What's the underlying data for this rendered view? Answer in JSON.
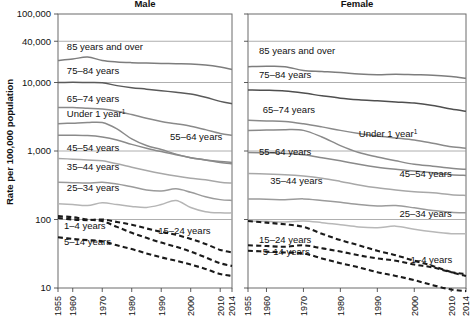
{
  "figure": {
    "y_axis_title": "Rate per 100,000 population",
    "panels": [
      {
        "id": "male",
        "title": "Male"
      },
      {
        "id": "female",
        "title": "Female"
      }
    ],
    "y_ticks": [
      {
        "value": 10,
        "label": "10"
      },
      {
        "value": 100,
        "label": "100"
      },
      {
        "value": 1000,
        "label": "1,000"
      },
      {
        "value": 10000,
        "label": "10,000"
      },
      {
        "value": 40000,
        "label": "40,000"
      },
      {
        "value": 100000,
        "label": "100,000"
      }
    ],
    "x_ticks": [
      {
        "value": 1955,
        "label": "1955"
      },
      {
        "value": 1960,
        "label": "1960"
      },
      {
        "value": 1970,
        "label": "1970"
      },
      {
        "value": 1980,
        "label": "1980"
      },
      {
        "value": 1990,
        "label": "1990"
      },
      {
        "value": 2000,
        "label": "2000"
      },
      {
        "value": 2010,
        "label": "2010"
      },
      {
        "value": 2014,
        "label": "2014"
      }
    ],
    "footnote_marker": "1"
  },
  "chart_data": {
    "type": "line",
    "xlabel": "",
    "ylabel": "Rate per 100,000 population",
    "yscale": "log",
    "ylim": [
      10,
      100000
    ],
    "xlim": [
      1955,
      2014
    ],
    "grid": true,
    "legend": "inline-labels",
    "x": [
      1955,
      1960,
      1965,
      1970,
      1975,
      1980,
      1985,
      1990,
      1995,
      2000,
      2005,
      2010,
      2014
    ],
    "panels": [
      {
        "panel": "Male",
        "series": [
          {
            "name": "85 years and over",
            "label": "85 years and over",
            "style": "solid",
            "color": "#7d7d7d",
            "label_x": 1958,
            "label_y": 30000,
            "values": [
              21000,
              22000,
              23500,
              21000,
              20000,
              19500,
              19200,
              19000,
              18800,
              18600,
              18000,
              16800,
              15500
            ]
          },
          {
            "name": "75-84 years",
            "label": "75–84 years",
            "style": "solid",
            "color": "#5a5a5a",
            "label_x": 1958,
            "label_y": 13500,
            "values": [
              10000,
              10100,
              10000,
              9900,
              9000,
              8400,
              8000,
              7600,
              7200,
              6800,
              6100,
              5300,
              4900
            ]
          },
          {
            "name": "65-74 years",
            "label": "65–74 years",
            "style": "solid",
            "color": "#8a8a8a",
            "label_x": 1958,
            "label_y": 5200,
            "values": [
              4300,
              4300,
              4200,
              4100,
              3800,
              3400,
              3000,
              2700,
              2500,
              2300,
              2050,
              1800,
              1700
            ]
          },
          {
            "name": "Under 1 year",
            "label": "Under 1 year",
            "style": "solid",
            "color": "#8a8a8a",
            "label_x": 1958,
            "label_y": 3100,
            "values": [
              2500,
              2550,
              2600,
              2600,
              2100,
              1500,
              1200,
              1050,
              900,
              800,
              740,
              680,
              650
            ]
          },
          {
            "name": "55-64 years",
            "label": "55–64 years",
            "style": "solid",
            "color": "#8a8a8a",
            "label_x": 1993,
            "label_y": 1450,
            "values": [
              1700,
              1700,
              1680,
              1600,
              1450,
              1250,
              1100,
              980,
              880,
              800,
              740,
              700,
              680
            ]
          },
          {
            "name": "45-54 years",
            "label": "45–54 years",
            "style": "solid",
            "color": "#a8a8a8",
            "label_x": 1958,
            "label_y": 1000,
            "values": [
              780,
              760,
              740,
              720,
              650,
              580,
              520,
              470,
              430,
              400,
              380,
              350,
              340
            ]
          },
          {
            "name": "35-44 years",
            "label": "35–44 years",
            "style": "solid",
            "color": "#9b9b9b",
            "label_x": 1958,
            "label_y": 520,
            "values": [
              350,
              345,
              340,
              350,
              330,
              300,
              270,
              260,
              280,
              250,
              215,
              195,
              190
            ]
          },
          {
            "name": "25-34 years",
            "label": "25–34 years",
            "style": "solid",
            "color": "#b5b5b5",
            "label_x": 1958,
            "label_y": 260,
            "values": [
              170,
              165,
              160,
              175,
              165,
              155,
              150,
              165,
              190,
              150,
              130,
              125,
              125
            ]
          },
          {
            "name": "15-24 years",
            "label": "15–24 years",
            "style": "dashed",
            "color": "#1a1a1a",
            "label_x": 1989,
            "label_y": 62,
            "values": [
              105,
              100,
              98,
              100,
              92,
              84,
              74,
              66,
              60,
              52,
              44,
              36,
              33
            ]
          },
          {
            "name": "1-4 years",
            "label": "1–4 years",
            "style": "dashed",
            "color": "#1a1a1a",
            "label_x": 1957,
            "label_y": 72,
            "values": [
              112,
              108,
              100,
              95,
              78,
              64,
              54,
              46,
              40,
              34,
              28,
              23,
              21
            ]
          },
          {
            "name": "5-14 years",
            "label": "5–14 years",
            "style": "dashed",
            "color": "#1a1a1a",
            "label_x": 1957,
            "label_y": 43,
            "values": [
              55,
              52,
              50,
              48,
              42,
              37,
              32,
              28,
              25,
              22,
              19,
              16,
              15
            ]
          }
        ]
      },
      {
        "panel": "Female",
        "series": [
          {
            "name": "85 years and over",
            "label": "85 years and over",
            "style": "solid",
            "color": "#7d7d7d",
            "label_x": 1958,
            "label_y": 26000,
            "values": [
              17000,
              17200,
              17000,
              15000,
              14500,
              14000,
              13300,
              13000,
              13200,
              13000,
              12800,
              12200,
              11500
            ]
          },
          {
            "name": "75-84 years",
            "label": "75–84 years",
            "style": "solid",
            "color": "#4f4f4f",
            "label_x": 1958,
            "label_y": 11500,
            "values": [
              7800,
              7700,
              7500,
              7000,
              6400,
              5900,
              5600,
              5400,
              5200,
              5000,
              4600,
              4100,
              3800
            ]
          },
          {
            "name": "65-74 years",
            "label": "65–74 years",
            "style": "solid",
            "color": "#8a8a8a",
            "label_x": 1959,
            "label_y": 3600,
            "values": [
              2800,
              2750,
              2700,
              2500,
              2250,
              2000,
              1800,
              1650,
              1550,
              1450,
              1300,
              1150,
              1100
            ]
          },
          {
            "name": "Under 1 year",
            "label": "Under 1 year",
            "style": "solid",
            "color": "#8a8a8a",
            "label_x": 1985,
            "label_y": 1600,
            "values": [
              2000,
              2020,
              2050,
              2000,
              1600,
              1200,
              950,
              820,
              720,
              640,
              600,
              560,
              540
            ]
          },
          {
            "name": "55-64 years",
            "label": "55–64 years",
            "style": "solid",
            "color": "#8a8a8a",
            "label_x": 1958,
            "label_y": 880,
            "values": [
              950,
              940,
              920,
              880,
              800,
              720,
              640,
              580,
              540,
              510,
              480,
              450,
              440
            ]
          },
          {
            "name": "45-54 years",
            "label": "45–54 years",
            "style": "solid",
            "color": "#a8a8a8",
            "label_x": 1996,
            "label_y": 420,
            "values": [
              470,
              460,
              450,
              430,
              400,
              360,
              320,
              290,
              270,
              255,
              245,
              230,
              225
            ]
          },
          {
            "name": "35-44 years",
            "label": "35–44 years",
            "style": "solid",
            "color": "#9b9b9b",
            "label_x": 1961,
            "label_y": 330,
            "values": [
              200,
              198,
              195,
              200,
              190,
              178,
              165,
              158,
              160,
              148,
              135,
              128,
              125
            ]
          },
          {
            "name": "25-34 years",
            "label": "25–34 years",
            "style": "solid",
            "color": "#b8b8b8",
            "label_x": 1996,
            "label_y": 110,
            "values": [
              95,
              94,
              92,
              95,
              90,
              84,
              78,
              76,
              80,
              72,
              66,
              62,
              62
            ]
          },
          {
            "name": "15-24 years",
            "label": "15–24 years",
            "style": "dashed",
            "color": "#1a1a1a",
            "label_x": 1958,
            "label_y": 46,
            "values": [
              42,
              41,
              40,
              42,
              38,
              34,
              30,
              27,
              25,
              22,
              20,
              17,
              16
            ]
          },
          {
            "name": "1-4 years",
            "label": "1–4 years",
            "style": "dashed",
            "color": "#1a1a1a",
            "label_x": 1999,
            "label_y": 23,
            "values": [
              95,
              90,
              85,
              78,
              62,
              50,
              42,
              35,
              30,
              25,
              21,
              17,
              15
            ]
          },
          {
            "name": "5-14 years",
            "label": "5–14 years",
            "style": "dashed",
            "color": "#1a1a1a",
            "label_x": 1959,
            "label_y": 30,
            "values": [
              35,
              34,
              33,
              32,
              27,
              23,
              20,
              17,
              15,
              13,
              11,
              9.5,
              9
            ]
          }
        ]
      }
    ]
  }
}
